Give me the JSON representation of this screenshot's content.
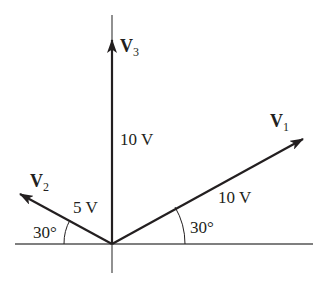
{
  "diagram": {
    "type": "phasor-diagram",
    "colors": {
      "line": "#231f20",
      "axis": "#444444",
      "background": "#ffffff"
    },
    "axes": {
      "origin": [
        112,
        244
      ],
      "horizontal": {
        "x1": 15,
        "x2": 313
      },
      "vertical": {
        "y1": 15,
        "y2": 273
      }
    },
    "vectors": [
      {
        "id": "v1",
        "name": "V",
        "subscript": "1",
        "magnitude_label": "10 V",
        "angle_label": "30°",
        "angle_deg": 30
      },
      {
        "id": "v2",
        "name": "V",
        "subscript": "2",
        "magnitude_label": "5 V",
        "angle_label": "30°",
        "angle_deg": 150
      },
      {
        "id": "v3",
        "name": "V",
        "subscript": "3",
        "magnitude_label": "10 V",
        "angle_deg": 90
      }
    ]
  }
}
